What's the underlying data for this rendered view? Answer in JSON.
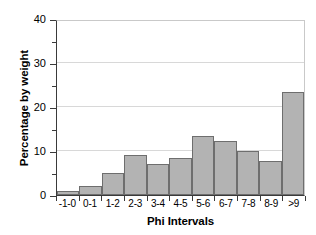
{
  "chart_data": {
    "type": "bar",
    "title": "",
    "xlabel": "Phi Intervals",
    "ylabel": "Percentage by weight",
    "categories": [
      "-1-0",
      "0-1",
      "1-2",
      "2-3",
      "3-4",
      "4-5",
      "5-6",
      "6-7",
      "7-8",
      "8-9",
      ">9"
    ],
    "values": [
      1.0,
      2.0,
      5.0,
      9.0,
      7.0,
      8.5,
      13.5,
      12.3,
      10.0,
      7.7,
      23.3
    ],
    "ylim": [
      0,
      40
    ],
    "yticks_major": [
      0,
      10,
      20,
      30,
      40
    ],
    "yticks_minor": [
      5,
      15,
      25,
      35
    ],
    "ytick_labels": [
      "0",
      "10",
      "20",
      "30",
      "40"
    ],
    "grid": true,
    "legend": "none",
    "bar_fill": "#b3b3b3",
    "bar_stroke": "#6e6e6e",
    "axis_color": "#3a3a3a",
    "grid_color": "#d8d8d8"
  }
}
